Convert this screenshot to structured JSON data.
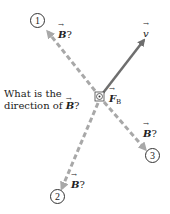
{
  "diagram": {
    "question": {
      "line1": "What is the",
      "line2_prefix": "direction of ",
      "line2_symbol": "B",
      "line2_suffix": "?"
    },
    "velocity": {
      "symbol": "v",
      "color": "#6b6b6b"
    },
    "force": {
      "symbol": "F",
      "subscript": "B",
      "direction": "out-of-page"
    },
    "candidates": [
      {
        "number": "1",
        "label_symbol": "B",
        "label_suffix": "?"
      },
      {
        "number": "2",
        "label_symbol": "B",
        "label_suffix": "?"
      },
      {
        "number": "3",
        "label_symbol": "B",
        "label_suffix": "?"
      }
    ],
    "colors": {
      "dashed": "#a8a8a8",
      "solid": "#6e6e6e",
      "text": "#222222"
    }
  }
}
